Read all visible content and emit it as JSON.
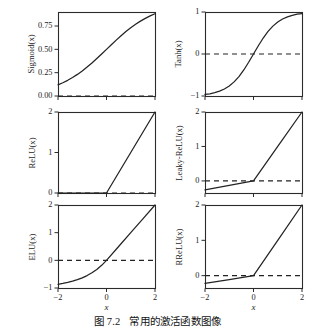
{
  "figure": {
    "caption_label": "图 7.2",
    "caption_text": "常用的激活函数图像",
    "x_axis_label": "x",
    "background_color": "#ffffff",
    "line_color": "#232323",
    "frame_color": "#2b2b2b"
  },
  "chart_data": [
    {
      "type": "line",
      "title": "",
      "ylabel": "Sigmoid(x)",
      "xlabel": "x",
      "xlim": [
        -2,
        2
      ],
      "ylim": [
        0.0,
        0.9
      ],
      "xticks": [
        -2,
        0,
        2
      ],
      "xticklabels": [
        "",
        "",
        ""
      ],
      "yticks": [
        0.0,
        0.25,
        0.5,
        0.75
      ],
      "yticklabels": [
        "0.00",
        "0.25",
        "0.50",
        "0.75"
      ],
      "grid": false,
      "legend": "none",
      "annotations": [
        "dashed horizontal reference line at y = 0"
      ],
      "series": [
        {
          "name": "Sigmoid(x)",
          "x": [
            -2.0,
            -1.8,
            -1.6,
            -1.4,
            -1.2,
            -1.0,
            -0.8,
            -0.6,
            -0.4,
            -0.2,
            0.0,
            0.2,
            0.4,
            0.6,
            0.8,
            1.0,
            1.2,
            1.4,
            1.6,
            1.8,
            2.0
          ],
          "values": [
            0.1192,
            0.1419,
            0.168,
            0.1978,
            0.2315,
            0.2689,
            0.31,
            0.3543,
            0.4013,
            0.4502,
            0.5,
            0.5498,
            0.5987,
            0.6457,
            0.69,
            0.7311,
            0.7685,
            0.8022,
            0.832,
            0.8581,
            0.8808
          ]
        },
        {
          "name": "zero-reference",
          "style": "dashed",
          "x": [
            -2.0,
            2.0
          ],
          "values": [
            0.0,
            0.0
          ]
        }
      ]
    },
    {
      "type": "line",
      "title": "",
      "ylabel": "Tanh(x)",
      "xlabel": "x",
      "xlim": [
        -2,
        2
      ],
      "ylim": [
        -1,
        1
      ],
      "xticks": [
        -2,
        0,
        2
      ],
      "xticklabels": [
        "",
        "",
        ""
      ],
      "yticks": [
        -1,
        0,
        1
      ],
      "yticklabels": [
        "-1",
        "0",
        "1"
      ],
      "grid": false,
      "legend": "none",
      "annotations": [
        "dashed horizontal reference line at y = 0"
      ],
      "series": [
        {
          "name": "Tanh(x)",
          "x": [
            -2.0,
            -1.8,
            -1.6,
            -1.4,
            -1.2,
            -1.0,
            -0.8,
            -0.6,
            -0.4,
            -0.2,
            0.0,
            0.2,
            0.4,
            0.6,
            0.8,
            1.0,
            1.2,
            1.4,
            1.6,
            1.8,
            2.0
          ],
          "values": [
            -0.964,
            -0.9468,
            -0.9217,
            -0.8854,
            -0.8337,
            -0.7616,
            -0.664,
            -0.537,
            -0.3799,
            -0.1974,
            0.0,
            0.1974,
            0.3799,
            0.537,
            0.664,
            0.7616,
            0.8337,
            0.8854,
            0.9217,
            0.9468,
            0.964
          ]
        },
        {
          "name": "zero-reference",
          "style": "dashed",
          "x": [
            -2.0,
            2.0
          ],
          "values": [
            0.0,
            0.0
          ]
        }
      ]
    },
    {
      "type": "line",
      "title": "",
      "ylabel": "ReLU(x)",
      "xlabel": "x",
      "xlim": [
        -2,
        2
      ],
      "ylim": [
        0,
        2
      ],
      "xticks": [
        -2,
        0,
        2
      ],
      "xticklabels": [
        "",
        "",
        ""
      ],
      "yticks": [
        0,
        1,
        2
      ],
      "yticklabels": [
        "0",
        "1",
        "2"
      ],
      "grid": false,
      "legend": "none",
      "annotations": [
        "dashed horizontal reference line at y = 0"
      ],
      "series": [
        {
          "name": "ReLU(x)",
          "x": [
            -2.0,
            -1.0,
            0.0,
            1.0,
            2.0
          ],
          "values": [
            0.0,
            0.0,
            0.0,
            1.0,
            2.0
          ]
        },
        {
          "name": "zero-reference",
          "style": "dashed",
          "x": [
            -2.0,
            2.0
          ],
          "values": [
            0.0,
            0.0
          ]
        }
      ]
    },
    {
      "type": "line",
      "title": "",
      "ylabel": "Leaky-ReLU(x)",
      "xlabel": "x",
      "xlim": [
        -2,
        2
      ],
      "ylim": [
        -0.35,
        2
      ],
      "xticks": [
        -2,
        0,
        2
      ],
      "xticklabels": [
        "",
        "",
        ""
      ],
      "yticks": [
        0,
        1,
        2
      ],
      "yticklabels": [
        "0",
        "1",
        "2"
      ],
      "grid": false,
      "legend": "none",
      "annotations": [
        "dashed horizontal reference line at y = 0",
        "negative slope approximately 0.13"
      ],
      "series": [
        {
          "name": "Leaky-ReLU(x)",
          "x": [
            -2.0,
            -1.0,
            0.0,
            1.0,
            2.0
          ],
          "values": [
            -0.26,
            -0.13,
            0.0,
            1.0,
            2.0
          ]
        },
        {
          "name": "zero-reference",
          "style": "dashed",
          "x": [
            -2.0,
            2.0
          ],
          "values": [
            0.0,
            0.0
          ]
        }
      ]
    },
    {
      "type": "line",
      "title": "",
      "ylabel": "ELU(x)",
      "xlabel": "x",
      "xlim": [
        -2,
        2
      ],
      "ylim": [
        -1,
        2
      ],
      "xticks": [
        -2,
        0,
        2
      ],
      "xticklabels": [
        "-2",
        "0",
        "2"
      ],
      "yticks": [
        -1,
        0,
        1,
        2
      ],
      "yticklabels": [
        "-1",
        "0",
        "1",
        "2"
      ],
      "grid": false,
      "legend": "none",
      "annotations": [
        "dashed horizontal reference line at y = 0"
      ],
      "series": [
        {
          "name": "ELU(x)",
          "x": [
            -2.0,
            -1.8,
            -1.6,
            -1.4,
            -1.2,
            -1.0,
            -0.8,
            -0.6,
            -0.4,
            -0.2,
            0.0,
            0.5,
            1.0,
            1.5,
            2.0
          ],
          "values": [
            -0.8647,
            -0.8347,
            -0.7981,
            -0.7534,
            -0.6988,
            -0.6321,
            -0.5507,
            -0.4512,
            -0.3297,
            -0.1813,
            0.0,
            0.5,
            1.0,
            1.5,
            2.0
          ]
        },
        {
          "name": "zero-reference",
          "style": "dashed",
          "x": [
            -2.0,
            2.0
          ],
          "values": [
            0.0,
            0.0
          ]
        }
      ]
    },
    {
      "type": "line",
      "title": "",
      "ylabel": "RReLU(x)",
      "xlabel": "x",
      "xlim": [
        -2,
        2
      ],
      "ylim": [
        -0.35,
        2
      ],
      "xticks": [
        -2,
        0,
        2
      ],
      "xticklabels": [
        "-2",
        "0",
        "2"
      ],
      "yticks": [
        0,
        1,
        2
      ],
      "yticklabels": [
        "0",
        "1",
        "2"
      ],
      "grid": false,
      "legend": "none",
      "annotations": [
        "dashed horizontal reference line at y = 0",
        "random negative slope approximately 0.11"
      ],
      "series": [
        {
          "name": "RReLU(x)",
          "x": [
            -2.0,
            -1.0,
            0.0,
            1.0,
            2.0
          ],
          "values": [
            -0.22,
            -0.11,
            0.0,
            1.0,
            2.0
          ]
        },
        {
          "name": "zero-reference",
          "style": "dashed",
          "x": [
            -2.0,
            2.0
          ],
          "values": [
            0.0,
            0.0
          ]
        }
      ]
    }
  ],
  "panels": [
    {
      "id": "sigmoid",
      "ylabel": "Sigmoid(x)",
      "left": 58,
      "top": 12,
      "width": 97,
      "height": 84,
      "show_xticklabels": false
    },
    {
      "id": "tanh",
      "ylabel": "Tanh(x)",
      "left": 205,
      "top": 12,
      "width": 97,
      "height": 84,
      "show_xticklabels": false
    },
    {
      "id": "relu",
      "ylabel": "ReLU(x)",
      "left": 58,
      "top": 112,
      "width": 97,
      "height": 81,
      "show_xticklabels": false
    },
    {
      "id": "leaky-relu",
      "ylabel": "Leaky-ReLU(x)",
      "left": 205,
      "top": 112,
      "width": 97,
      "height": 81,
      "show_xticklabels": false
    },
    {
      "id": "elu",
      "ylabel": "ELU(x)",
      "left": 58,
      "top": 205,
      "width": 97,
      "height": 83,
      "show_xticklabels": true
    },
    {
      "id": "rrelu",
      "ylabel": "RReLU(x)",
      "left": 205,
      "top": 205,
      "width": 97,
      "height": 83,
      "show_xticklabels": true
    }
  ]
}
